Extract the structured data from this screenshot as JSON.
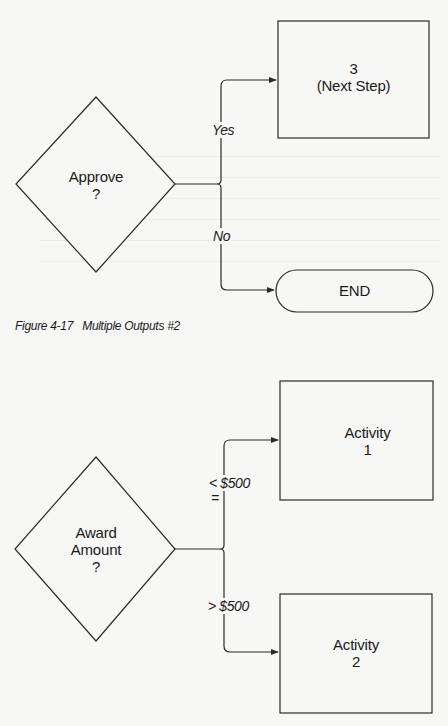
{
  "figure_top": {
    "decision": {
      "line1": "Approve",
      "line2": "?"
    },
    "edges": {
      "yes": "Yes",
      "no": "No"
    },
    "next_step": {
      "line1": "3",
      "line2": "(Next Step)"
    },
    "terminator": {
      "label": "END"
    }
  },
  "caption": {
    "number": "Figure 4-17",
    "title": "Multiple Outputs #2"
  },
  "figure_bottom": {
    "decision": {
      "line1": "Award",
      "line2": "Amount",
      "line3": "?"
    },
    "edges": {
      "le_top": "< $500",
      "le_bottom": "=",
      "gt": "> $500"
    },
    "activity1": {
      "line1": "Activity",
      "line2": "1"
    },
    "activity2": {
      "line1": "Activity",
      "line2": "2"
    }
  },
  "colors": {
    "background": "#f7f7f6",
    "stroke": "#2a2a2a",
    "text": "#1a1a1a"
  }
}
